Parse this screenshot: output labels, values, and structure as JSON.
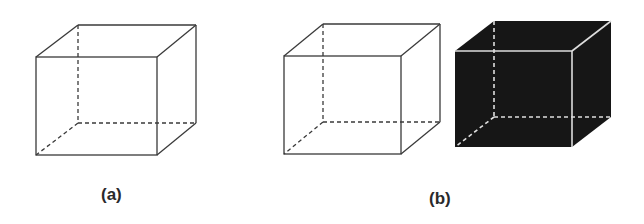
{
  "figure": {
    "labels": {
      "a": "(a)",
      "b": "(b)"
    },
    "colors": {
      "background": "#ffffff",
      "wire_edge": "#3a3a3a",
      "solid_fill": "#161616",
      "solid_edge": "#dedede"
    },
    "cubes": [
      {
        "name": "wireframe-cube-a",
        "style": "wireframe",
        "front": {
          "x1": 36,
          "y1": 57,
          "x2": 157,
          "y2": 155
        },
        "back": {
          "x1": 78,
          "y1": 25,
          "x2": 196,
          "y2": 123
        }
      },
      {
        "name": "wireframe-cube-b",
        "style": "wireframe",
        "front": {
          "x1": 284,
          "y1": 56,
          "x2": 401,
          "y2": 154
        },
        "back": {
          "x1": 323,
          "y1": 24,
          "x2": 440,
          "y2": 122
        }
      },
      {
        "name": "solid-cube-b",
        "style": "solid",
        "front": {
          "x1": 455,
          "y1": 51,
          "x2": 572,
          "y2": 147
        },
        "back": {
          "x1": 494,
          "y1": 21,
          "x2": 611,
          "y2": 117
        }
      }
    ]
  }
}
